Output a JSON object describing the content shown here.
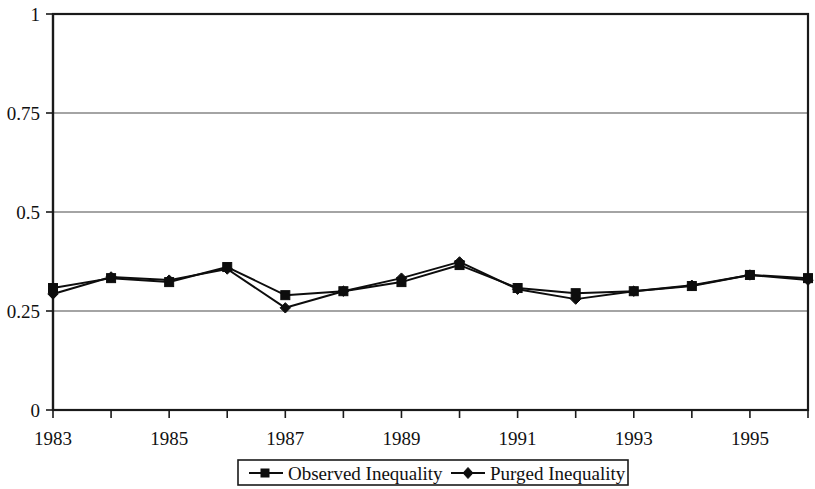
{
  "chart_data": {
    "type": "line",
    "title": "",
    "subtitle": "",
    "xlabel": "",
    "ylabel": "",
    "x": [
      1983,
      1984,
      1985,
      1986,
      1987,
      1988,
      1989,
      1990,
      1991,
      1992,
      1993,
      1994,
      1995,
      1996
    ],
    "categories": [
      "1983",
      "1984",
      "1985",
      "1986",
      "1987",
      "1988",
      "1989",
      "1990",
      "1991",
      "1992",
      "1993",
      "1994",
      "1995",
      "1996"
    ],
    "series": [
      {
        "name": "Observed Inequality",
        "marker": "square",
        "color": "#0d0d0d",
        "values": [
          0.308,
          0.333,
          0.323,
          0.361,
          0.29,
          0.3,
          0.323,
          0.366,
          0.308,
          0.295,
          0.3,
          0.313,
          0.341,
          0.333
        ]
      },
      {
        "name": "Purged Inequality",
        "marker": "diamond",
        "color": "#0d0d0d",
        "values": [
          0.293,
          0.336,
          0.328,
          0.356,
          0.258,
          0.3,
          0.333,
          0.374,
          0.305,
          0.28,
          0.3,
          0.315,
          0.341,
          0.328
        ]
      }
    ],
    "ylim": [
      0,
      1
    ],
    "y_ticks": [
      0,
      0.25,
      0.5,
      0.75,
      1
    ],
    "y_tick_labels": [
      "0",
      "0.25",
      "0.5",
      "0.75",
      "1"
    ],
    "x_ticks": [
      1983,
      1984,
      1985,
      1986,
      1987,
      1988,
      1989,
      1990,
      1991,
      1992,
      1993,
      1994,
      1995,
      1996
    ],
    "x_tick_labels": [
      "1983",
      "",
      "1985",
      "",
      "1987",
      "",
      "1989",
      "",
      "1991",
      "",
      "1993",
      "",
      "1995",
      ""
    ],
    "x_labeled_ticks": [
      "1983",
      "1985",
      "1987",
      "1989",
      "1991",
      "1993",
      "1995"
    ],
    "grid": true,
    "grid_axis": "y",
    "legend": {
      "position": "bottom",
      "entries": [
        {
          "label": "Observed Inequality",
          "marker": "square"
        },
        {
          "label": "Purged Inequality",
          "marker": "diamond"
        }
      ]
    }
  },
  "axes": {
    "y_labels": [
      "1",
      "0.75",
      "0.5",
      "0.25",
      "0"
    ],
    "x_labels": [
      "1983",
      "1985",
      "1987",
      "1989",
      "1991",
      "1993",
      "1995"
    ]
  },
  "legend": {
    "observed_label": "Observed Inequality",
    "purged_label": "Purged Inequality"
  }
}
